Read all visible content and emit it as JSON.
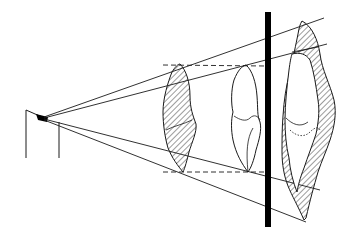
{
  "diagram": {
    "type": "projection-geometry",
    "colors": {
      "line": "#1a1a1a",
      "detector": "#000000",
      "background": "#ffffff",
      "hatch": "#222222"
    },
    "elements": [
      {
        "id": "source",
        "label": "point-source"
      },
      {
        "id": "object-hatched-left",
        "label": "hatched-object-near-source"
      },
      {
        "id": "object-outline-middle",
        "label": "outlined-object"
      },
      {
        "id": "detector-plane",
        "label": "detector-bar"
      },
      {
        "id": "projection-right",
        "label": "magnified-projection"
      }
    ]
  }
}
